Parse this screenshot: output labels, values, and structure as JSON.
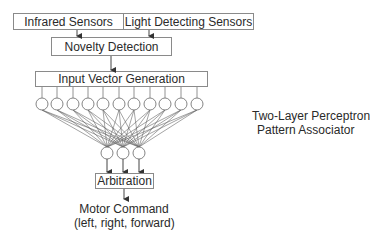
{
  "diagram": {
    "sensors": {
      "infrared": "Infrared Sensors",
      "light": "Light Detecting Sensors"
    },
    "novelty_detection": "Novelty Detection",
    "input_vector_generation": "Input Vector Generation",
    "perceptron_label": {
      "line1": "Two-Layer Perceptron",
      "line2": "Pattern Associator"
    },
    "arbitration": "Arbitration",
    "motor_command": {
      "line1": "Motor Command",
      "line2": "(left, right, forward)"
    },
    "network": {
      "input_node_count": 11,
      "output_node_count": 3,
      "connectivity": "fully-connected"
    },
    "colors": {
      "line": "#555555",
      "box_border": "#8a8a8a",
      "text": "#2a2a2a"
    }
  }
}
